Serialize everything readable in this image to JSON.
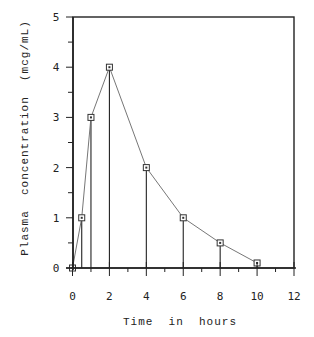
{
  "chart_data": {
    "type": "line",
    "title": "",
    "xlabel": "Time  in  hours",
    "ylabel": "Plasma  concentration  (mcg/mL)",
    "xlim": [
      0,
      12
    ],
    "ylim": [
      0,
      5
    ],
    "x_ticks": [
      "0",
      "2",
      "4",
      "6",
      "8",
      "10",
      "12"
    ],
    "y_ticks": [
      "0",
      "1",
      "2",
      "3",
      "4",
      "5"
    ],
    "grid": false,
    "legend": null,
    "series": [
      {
        "name": "Plasma concentration",
        "x": [
          0,
          0.5,
          1,
          2,
          4,
          6,
          8,
          10
        ],
        "values": [
          0,
          1,
          3,
          4,
          2,
          1,
          0.5,
          0.1
        ],
        "marker": "square-dot",
        "line_style": "thin",
        "drop_lines": true
      }
    ]
  },
  "colors": {
    "axis": "#222222",
    "line": "#555555",
    "marker": "#333333",
    "background": "#ffffff"
  }
}
